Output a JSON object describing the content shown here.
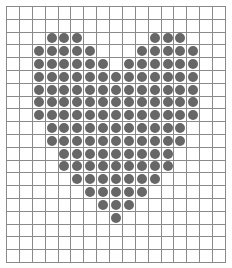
{
  "grid": {
    "columns": 17,
    "rows": 20,
    "line_color": "#8a8a8a",
    "dot_color": "#676767",
    "background": "#ffffff"
  },
  "pattern": {
    "shape": "heart",
    "filled_rows": [
      {
        "row": 2,
        "cols": [
          3,
          4,
          5,
          11,
          12,
          13
        ]
      },
      {
        "row": 3,
        "cols": [
          2,
          3,
          4,
          5,
          6,
          10,
          11,
          12,
          13,
          14
        ]
      },
      {
        "row": 4,
        "cols": [
          2,
          3,
          4,
          5,
          6,
          7,
          9,
          10,
          11,
          12,
          13,
          14
        ]
      },
      {
        "row": 5,
        "cols": [
          2,
          3,
          4,
          5,
          6,
          7,
          8,
          9,
          10,
          11,
          12,
          13,
          14
        ]
      },
      {
        "row": 6,
        "cols": [
          2,
          3,
          4,
          5,
          6,
          7,
          8,
          9,
          10,
          11,
          12,
          13,
          14
        ]
      },
      {
        "row": 7,
        "cols": [
          2,
          3,
          4,
          5,
          6,
          7,
          8,
          9,
          10,
          11,
          12,
          13,
          14
        ]
      },
      {
        "row": 8,
        "cols": [
          2,
          3,
          4,
          5,
          6,
          7,
          8,
          9,
          10,
          11,
          12,
          13,
          14
        ]
      },
      {
        "row": 9,
        "cols": [
          3,
          4,
          5,
          6,
          7,
          8,
          9,
          10,
          11,
          12,
          13
        ]
      },
      {
        "row": 10,
        "cols": [
          3,
          4,
          5,
          6,
          7,
          8,
          9,
          10,
          11,
          12,
          13
        ]
      },
      {
        "row": 11,
        "cols": [
          4,
          5,
          6,
          7,
          8,
          9,
          10,
          11,
          12
        ]
      },
      {
        "row": 12,
        "cols": [
          4,
          5,
          6,
          7,
          8,
          9,
          10,
          11,
          12
        ]
      },
      {
        "row": 13,
        "cols": [
          5,
          6,
          7,
          8,
          9,
          10,
          11
        ]
      },
      {
        "row": 14,
        "cols": [
          6,
          7,
          8,
          9,
          10
        ]
      },
      {
        "row": 15,
        "cols": [
          7,
          8,
          9
        ]
      },
      {
        "row": 16,
        "cols": [
          8
        ]
      }
    ]
  }
}
